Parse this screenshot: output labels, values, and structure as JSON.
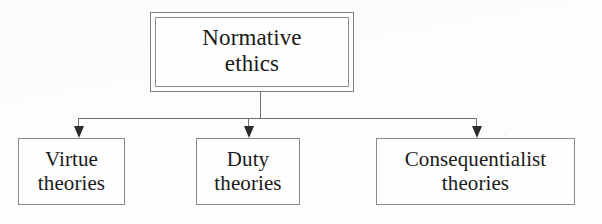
{
  "diagram": {
    "title": "Normative ethics",
    "type": "tree-hierarchy",
    "root": {
      "id": "normative-ethics",
      "label": "Normative\nethics",
      "label_line1": "Normative",
      "label_line2": "ethics",
      "border_style": "double",
      "box": {
        "x": 150,
        "y": 12,
        "width": 204,
        "height": 80
      }
    },
    "children": [
      {
        "id": "virtue-theories",
        "label_line1": "Virtue",
        "label_line2": "theories",
        "border_style": "single",
        "box": {
          "x": 18,
          "y": 138,
          "width": 107,
          "height": 67
        }
      },
      {
        "id": "duty-theories",
        "label_line1": "Duty",
        "label_line2": "theories",
        "border_style": "single",
        "box": {
          "x": 196,
          "y": 138,
          "width": 104,
          "height": 67
        }
      },
      {
        "id": "consequentialist-theories",
        "label_line1": "Consequentialist",
        "label_line2": "theories",
        "border_style": "single",
        "box": {
          "x": 376,
          "y": 138,
          "width": 199,
          "height": 67
        }
      }
    ],
    "connectors": {
      "style": "orthogonal-with-arrowheads",
      "arrow_direction": "down",
      "arrow_count": 3,
      "bus_y": 118,
      "bus_x_start": 78,
      "bus_x_end": 477
    },
    "colors": {
      "background": "#fdfdfc",
      "box_fill": "#fefefe",
      "box_border": "#8a8a8a",
      "root_border": "#7d7d7d",
      "connector_line": "#6f6f6f",
      "arrowhead": "#2b2b2b",
      "text": "#1a1a1a"
    }
  }
}
